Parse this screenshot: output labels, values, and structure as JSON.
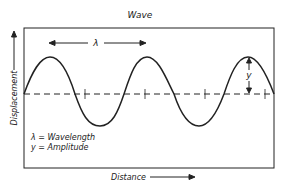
{
  "title": "Wave",
  "y_axis_label": "Displacement",
  "x_axis_label": "Distance",
  "wavelength_symbol": "λ",
  "amplitude_symbol": "y",
  "legend": {
    "line1": "λ = Wavelength",
    "line2": "y = Amplitude"
  },
  "colors": {
    "stroke": "#222222",
    "background": "#ffffff"
  }
}
